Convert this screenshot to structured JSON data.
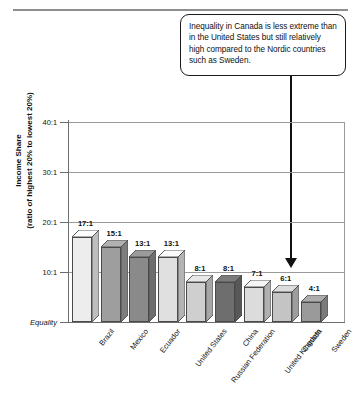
{
  "callout": {
    "text": "Inequality in Canada is less extreme than in the United States but still relatively high compared to the Nordic countries such as Sweden.",
    "arrow_target": "Canada"
  },
  "axis_title": {
    "line1": "Income Share",
    "line2": "(ratio of highest 20% to lowest 20%)"
  },
  "y_ticks": [
    {
      "label": "40:1",
      "value": 40
    },
    {
      "label": "30:1",
      "value": 30
    },
    {
      "label": "20:1",
      "value": 20
    },
    {
      "label": "10:1",
      "value": 10
    },
    {
      "label": "Equality",
      "value": 0
    }
  ],
  "chart_data": {
    "type": "bar",
    "title": "",
    "xlabel": "",
    "ylabel": "Income Share (ratio of highest 20% to lowest 20%)",
    "ylim": [
      0,
      40
    ],
    "grid": true,
    "legend": "none",
    "categories": [
      "Brazil",
      "Mexico",
      "Ecuador",
      "United States",
      "Russian Federation",
      "China",
      "United Kingdom",
      "Canada",
      "Sweden"
    ],
    "values": [
      17,
      15,
      13,
      13,
      8,
      8,
      7,
      6,
      4
    ],
    "value_labels": [
      "17:1",
      "15:1",
      "13:1",
      "13:1",
      "8:1",
      "8:1",
      "7:1",
      "6:1",
      "4:1"
    ],
    "bar_colors": [
      "#ededed",
      "#9e9e9e",
      "#8a8a8a",
      "#e0e0e0",
      "#cfcfcf",
      "#6e6e6e",
      "#dcdcdc",
      "#c4c4c4",
      "#9a9a9a"
    ],
    "tick_labels_y": [
      "Equality",
      "10:1",
      "20:1",
      "30:1",
      "40:1"
    ],
    "annotations": [
      {
        "text": "Inequality in Canada is less extreme than in the United States but still relatively high compared to the Nordic countries such as Sweden.",
        "points_to": "Canada"
      }
    ]
  }
}
